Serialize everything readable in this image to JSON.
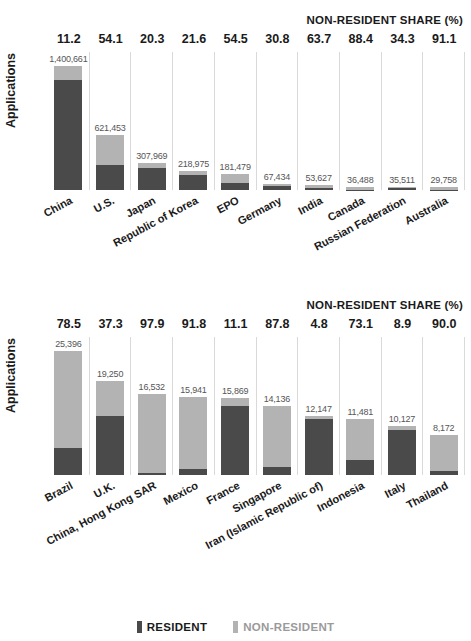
{
  "legend": {
    "resident_label": "RESIDENT",
    "nonresident_label": "NON-RESIDENT",
    "resident_color": "#4a4a4a",
    "nonresident_color": "#b3b3b3"
  },
  "charts": [
    {
      "id": "chart-top",
      "share_title": "NON-RESIDENT SHARE (%)",
      "ylabel": "Applications"
    },
    {
      "id": "chart-bottom",
      "share_title": "NON-RESIDENT SHARE (%)",
      "ylabel": "Applications"
    }
  ],
  "chart_data": [
    {
      "type": "bar",
      "title": "",
      "subtitle": "NON-RESIDENT SHARE (%)",
      "xlabel": "",
      "ylabel": "Applications",
      "stacked": true,
      "grid": "vertical",
      "legend_position": "bottom",
      "ylim": [
        0,
        1400661
      ],
      "categories": [
        "China",
        "U.S.",
        "Japan",
        "Republic of Korea",
        "EPO",
        "Germany",
        "India",
        "Canada",
        "Russian Federation",
        "Australia"
      ],
      "totals": [
        1400661,
        621453,
        307969,
        218975,
        181479,
        67434,
        53627,
        36488,
        35511,
        29758
      ],
      "total_labels": [
        "1,400,661",
        "621,453",
        "307,969",
        "218,975",
        "181,479",
        "67,434",
        "53,627",
        "36,488",
        "35,511",
        "29,758"
      ],
      "nonresident_share_pct": [
        11.2,
        54.1,
        20.3,
        21.6,
        54.5,
        30.8,
        63.7,
        88.4,
        34.3,
        91.1
      ],
      "nonresident_share_labels": [
        "11.2",
        "54.1",
        "20.3",
        "21.6",
        "54.5",
        "30.8",
        "63.7",
        "88.4",
        "34.3",
        "91.1"
      ],
      "series": [
        {
          "name": "RESIDENT",
          "color": "#4a4a4a",
          "values": [
            1243787,
            285247,
            245371,
            171676,
            82573,
            46664,
            19467,
            4233,
            23331,
            2649
          ]
        },
        {
          "name": "NON-RESIDENT",
          "color": "#b3b3b3",
          "values": [
            156874,
            336206,
            62518,
            47299,
            98906,
            20770,
            34160,
            32255,
            12180,
            27109
          ]
        }
      ]
    },
    {
      "type": "bar",
      "title": "",
      "subtitle": "NON-RESIDENT SHARE (%)",
      "xlabel": "",
      "ylabel": "Applications",
      "stacked": true,
      "grid": "vertical",
      "legend_position": "bottom",
      "ylim": [
        0,
        25396
      ],
      "categories": [
        "Brazil",
        "U.K.",
        "China, Hong Kong SAR",
        "Mexico",
        "France",
        "Singapore",
        "Iran (Islamic Republic of)",
        "Indonesia",
        "Italy",
        "Thailand"
      ],
      "totals": [
        25396,
        19250,
        16532,
        15941,
        15869,
        14136,
        12147,
        11481,
        10127,
        8172
      ],
      "total_labels": [
        "25,396",
        "19,250",
        "16,532",
        "15,941",
        "15,869",
        "14,136",
        "12,147",
        "11,481",
        "10,127",
        "8,172"
      ],
      "nonresident_share_pct": [
        78.5,
        37.3,
        97.9,
        91.8,
        11.1,
        87.8,
        4.8,
        73.1,
        8.9,
        90.0
      ],
      "nonresident_share_labels": [
        "78.5",
        "37.3",
        "97.9",
        "91.8",
        "11.1",
        "87.8",
        "4.8",
        "73.1",
        "8.9",
        "90.0"
      ],
      "series": [
        {
          "name": "RESIDENT",
          "color": "#4a4a4a",
          "values": [
            5460,
            12070,
            347,
            1307,
            14108,
            1725,
            11564,
            3088,
            9226,
            817
          ]
        },
        {
          "name": "NON-RESIDENT",
          "color": "#b3b3b3",
          "values": [
            19936,
            7180,
            16185,
            14634,
            1761,
            12411,
            583,
            8393,
            901,
            7355
          ]
        }
      ]
    }
  ]
}
